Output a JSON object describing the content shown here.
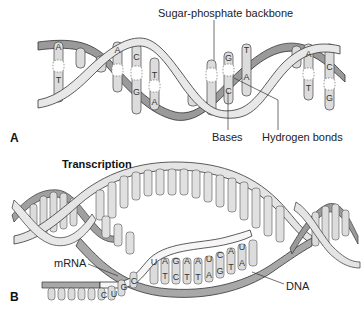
{
  "panel_a": {
    "letter": "A",
    "labels": {
      "backbone": "Sugar-phosphate backbone",
      "bases": "Bases",
      "hydrogen_bonds": "Hydrogen bonds"
    },
    "base_pairs": [
      {
        "top": "A",
        "bottom": "T"
      },
      {
        "top": "A",
        "bottom": ""
      },
      {
        "top": "C",
        "bottom": "G"
      },
      {
        "top": "T",
        "bottom": "A"
      },
      {
        "top": "G",
        "bottom": "C"
      },
      {
        "top": "T",
        "bottom": "A"
      },
      {
        "top": "A",
        "bottom": "T"
      },
      {
        "top": "C",
        "bottom": "G"
      }
    ]
  },
  "panel_b": {
    "letter": "B",
    "title": "Transcription",
    "labels": {
      "mrna": "mRNA",
      "dna": "DNA"
    },
    "mrna_bases": [
      "C",
      "U",
      "G",
      "C",
      "U",
      "A",
      "G",
      "A",
      "A",
      "U",
      "C",
      "A",
      "U"
    ],
    "dna_template_bases": [
      "T",
      "C",
      "T",
      "T",
      "A",
      "G",
      "T",
      "A"
    ]
  },
  "colors": {
    "backbone_light": "#e6e6e6",
    "backbone_dark": "#9a9a9a",
    "base_fill": "#d9d9d9",
    "outline": "#333333",
    "mrna_fill": "#f4f4f4",
    "mrna_tail": "#a8a8a8"
  }
}
